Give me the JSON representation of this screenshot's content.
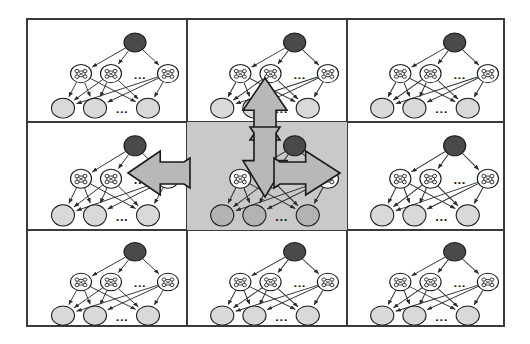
{
  "figure": {
    "title": "",
    "type": "diagram",
    "frame": {
      "x": 26,
      "y": 18,
      "width": 479,
      "height": 309,
      "border_color": "#3a3a3a",
      "border_width": 2
    },
    "grid": {
      "rows": 3,
      "cols": 3,
      "col_edges": [
        26,
        185,
        345,
        505
      ],
      "row_edges": [
        18,
        120,
        228,
        327
      ],
      "divider_color": "#3a3a3a",
      "highlight_cell": {
        "row": 1,
        "col": 1
      },
      "highlight_color": "#c9c9c9"
    },
    "cells": [
      {
        "id": "cell-r0c0",
        "label": "network-panel-top-left",
        "highlighted": false
      },
      {
        "id": "cell-r0c1",
        "label": "network-panel-top-center",
        "highlighted": false
      },
      {
        "id": "cell-r0c2",
        "label": "network-panel-top-right",
        "highlighted": false
      },
      {
        "id": "cell-r1c0",
        "label": "network-panel-middle-left",
        "highlighted": false
      },
      {
        "id": "cell-r1c1",
        "label": "network-panel-center",
        "highlighted": true
      },
      {
        "id": "cell-r1c2",
        "label": "network-panel-middle-right",
        "highlighted": false
      },
      {
        "id": "cell-r2c0",
        "label": "network-panel-bottom-left",
        "highlighted": false
      },
      {
        "id": "cell-r2c1",
        "label": "network-panel-bottom-center",
        "highlighted": false
      },
      {
        "id": "cell-r2c2",
        "label": "network-panel-bottom-right",
        "highlighted": false
      }
    ],
    "network": {
      "layers": [
        {
          "name": "root-layer",
          "node_count": 1,
          "node_style": "filled-dark",
          "fill": "#4a4a4a",
          "stroke": "#1a1a1a",
          "radius": 11,
          "nodes": [
            {
              "id": "root",
              "cx": 107,
              "cy": 26
            }
          ]
        },
        {
          "name": "hidden-layer",
          "node_count": 3,
          "node_style": "white-with-glyph",
          "fill": "#ffffff",
          "stroke": "#1a1a1a",
          "radius": 10.5,
          "glyph": "lattice-icon",
          "ellipsis_after_index": 1,
          "nodes": [
            {
              "id": "h1",
              "cx": 53,
              "cy": 62
            },
            {
              "id": "h2",
              "cx": 83,
              "cy": 62
            },
            {
              "id": "h3",
              "cx": 140,
              "cy": 62
            }
          ],
          "ellipsis": {
            "cx": 112,
            "cy": 64,
            "text": "..."
          }
        },
        {
          "name": "leaf-layer",
          "node_count": 3,
          "node_style": "filled-light",
          "fill": "#d9d9d9",
          "fill_highlighted": "#b3b3b3",
          "stroke": "#1a1a1a",
          "radius": 11.5,
          "ellipsis_after_index": 1,
          "nodes": [
            {
              "id": "l1",
              "cx": 35,
              "cy": 102
            },
            {
              "id": "l2",
              "cx": 67,
              "cy": 102
            },
            {
              "id": "l3",
              "cx": 120,
              "cy": 102
            }
          ],
          "ellipsis": {
            "cx": 94,
            "cy": 104,
            "text": "..."
          }
        }
      ],
      "edges": [
        {
          "from": "root",
          "to": "h1"
        },
        {
          "from": "root",
          "to": "h2"
        },
        {
          "from": "root",
          "to": "h3"
        },
        {
          "from": "h1",
          "to": "l1"
        },
        {
          "from": "h1",
          "to": "l2"
        },
        {
          "from": "h1",
          "to": "l3"
        },
        {
          "from": "h2",
          "to": "l1"
        },
        {
          "from": "h2",
          "to": "l2"
        },
        {
          "from": "h2",
          "to": "l3"
        },
        {
          "from": "h3",
          "to": "l1"
        },
        {
          "from": "h3",
          "to": "l2"
        },
        {
          "from": "h3",
          "to": "l3"
        }
      ],
      "edge_color": "#2b2b2b",
      "edge_width": 1,
      "arrowhead": "solid-triangle",
      "ellipsis_label": "..."
    },
    "block_arrows": [
      {
        "id": "arrow-up",
        "direction": "up",
        "label": "expand-arrow-up",
        "x": 265,
        "y": 78,
        "length": 62,
        "shaft_width": 22,
        "head_width": 44,
        "fill": "#b8b8b8",
        "stroke": "#1a1a1a"
      },
      {
        "id": "arrow-down",
        "direction": "down",
        "label": "expand-arrow-down",
        "x": 265,
        "y": 197,
        "length": 70,
        "shaft_width": 22,
        "head_width": 44,
        "fill": "#b8b8b8",
        "stroke": "#1a1a1a"
      },
      {
        "id": "arrow-left",
        "direction": "left",
        "label": "expand-arrow-left",
        "x": 128,
        "y": 173,
        "length": 62,
        "shaft_width": 22,
        "head_width": 44,
        "fill": "#b8b8b8",
        "stroke": "#1a1a1a"
      },
      {
        "id": "arrow-right",
        "direction": "right",
        "label": "expand-arrow-right",
        "x": 340,
        "y": 173,
        "length": 66,
        "shaft_width": 22,
        "head_width": 44,
        "fill": "#b8b8b8",
        "stroke": "#1a1a1a"
      }
    ]
  }
}
